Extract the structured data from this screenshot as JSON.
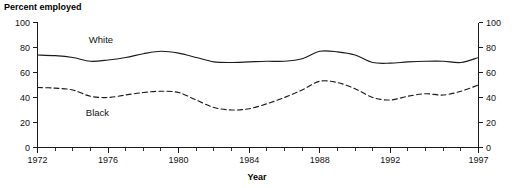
{
  "chart_data": {
    "type": "line",
    "title": "",
    "xlabel": "Year",
    "ylabel": "Percent employed",
    "ylabel_position": "top-left",
    "xlim": [
      1972,
      1997
    ],
    "ylim": [
      0,
      100
    ],
    "grid": false,
    "legend_position": "inline-annotation",
    "y_ticks": [
      0,
      20,
      40,
      60,
      80,
      100
    ],
    "y_tick_labels": [
      "0",
      "20",
      "40",
      "60",
      "80",
      "100"
    ],
    "y_axis_duplicated_right": true,
    "x_ticks": [
      1972,
      1973,
      1974,
      1975,
      1976,
      1977,
      1978,
      1979,
      1980,
      1981,
      1982,
      1983,
      1984,
      1985,
      1986,
      1987,
      1988,
      1989,
      1990,
      1991,
      1992,
      1993,
      1994,
      1995,
      1996,
      1997
    ],
    "x_tick_labels_shown": [
      "1972",
      "1976",
      "1980",
      "1984",
      "1988",
      "1992",
      "1997"
    ],
    "x": [
      1972,
      1973,
      1974,
      1975,
      1976,
      1977,
      1978,
      1979,
      1980,
      1981,
      1982,
      1983,
      1984,
      1985,
      1986,
      1987,
      1988,
      1989,
      1990,
      1991,
      1992,
      1993,
      1994,
      1995,
      1996,
      1997
    ],
    "series": [
      {
        "name": "White",
        "style": "solid",
        "color": "#1a1a1a",
        "label": "White",
        "label_x": 1975.6,
        "label_y": 86,
        "values": [
          74,
          73.5,
          72,
          69,
          70,
          72,
          75,
          77,
          75.5,
          72,
          68.5,
          68,
          68.5,
          69,
          69,
          71,
          77,
          76.5,
          74,
          68,
          67.5,
          68.5,
          69,
          69,
          68,
          72
        ]
      },
      {
        "name": "Black",
        "style": "dashed",
        "color": "#1a1a1a",
        "label": "Black",
        "label_x": 1975.4,
        "label_y": 28,
        "values": [
          48,
          47.5,
          46,
          41,
          40,
          42,
          44,
          45,
          44,
          38,
          32,
          30,
          31,
          35,
          40,
          46,
          53,
          52,
          47,
          40,
          38,
          41,
          43,
          42,
          45,
          50
        ]
      }
    ]
  },
  "labels": {
    "y_axis_title": "Percent employed",
    "x_axis_title": "Year"
  }
}
